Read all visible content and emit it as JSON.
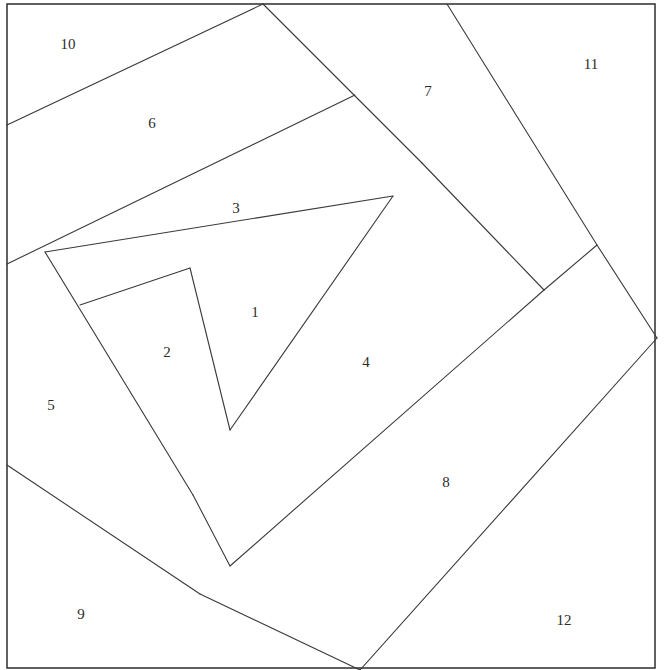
{
  "figure": {
    "type": "line-partition",
    "width": 665,
    "height": 670,
    "background_color": "#ffffff",
    "line_color": "#3a3a3a",
    "label_color": "#2b2b2b",
    "frame": {
      "x": 7,
      "y": 4,
      "width": 648,
      "height": 664
    }
  },
  "regions": [
    {
      "id": "1",
      "label": "1",
      "label_x": 255,
      "label_y": 314
    },
    {
      "id": "2",
      "label": "2",
      "label_x": 167,
      "label_y": 354
    },
    {
      "id": "3",
      "label": "3",
      "label_x": 236,
      "label_y": 210
    },
    {
      "id": "4",
      "label": "4",
      "label_x": 366,
      "label_y": 364
    },
    {
      "id": "5",
      "label": "5",
      "label_x": 51,
      "label_y": 407
    },
    {
      "id": "6",
      "label": "6",
      "label_x": 152,
      "label_y": 125
    },
    {
      "id": "7",
      "label": "7",
      "label_x": 428,
      "label_y": 93
    },
    {
      "id": "8",
      "label": "8",
      "label_x": 446,
      "label_y": 484
    },
    {
      "id": "9",
      "label": "9",
      "label_x": 81,
      "label_y": 616
    },
    {
      "id": "10",
      "label": "10",
      "label_x": 68,
      "label_y": 46
    },
    {
      "id": "11",
      "label": "11",
      "label_x": 591,
      "label_y": 66
    },
    {
      "id": "12",
      "label": "12",
      "label_x": 564,
      "label_y": 622
    }
  ],
  "edges": [
    {
      "name": "edge-10-6",
      "points": "7,125 263,4"
    },
    {
      "name": "edge-6-3",
      "points": "7,264 355,95"
    },
    {
      "name": "edge-3-top",
      "points": "263,4 422,163"
    },
    {
      "name": "edge-7-11",
      "points": "447,4 597,245"
    },
    {
      "name": "edge-7-4",
      "points": "422,163 544,290"
    },
    {
      "name": "edge-3-1",
      "points": "45,252 393,196"
    },
    {
      "name": "edge-1-4",
      "points": "393,196 230,430"
    },
    {
      "name": "edge-5-2",
      "points": "45,252 193,495"
    },
    {
      "name": "edge-2-1",
      "points": "80,305 190,268"
    },
    {
      "name": "edge-2-1-inner",
      "points": "190,268 230,430"
    },
    {
      "name": "edge-2-4",
      "points": "193,495 230,566"
    },
    {
      "name": "edge-5-9",
      "points": "7,465 200,594"
    },
    {
      "name": "edge-9-8",
      "points": "200,594 360,670"
    },
    {
      "name": "edge-4-8",
      "points": "230,566 544,290"
    },
    {
      "name": "edge-8-11",
      "points": "544,290 597,245"
    },
    {
      "name": "edge-11-12",
      "points": "597,245 657,338"
    },
    {
      "name": "edge-8-12",
      "points": "657,338 360,670"
    }
  ]
}
